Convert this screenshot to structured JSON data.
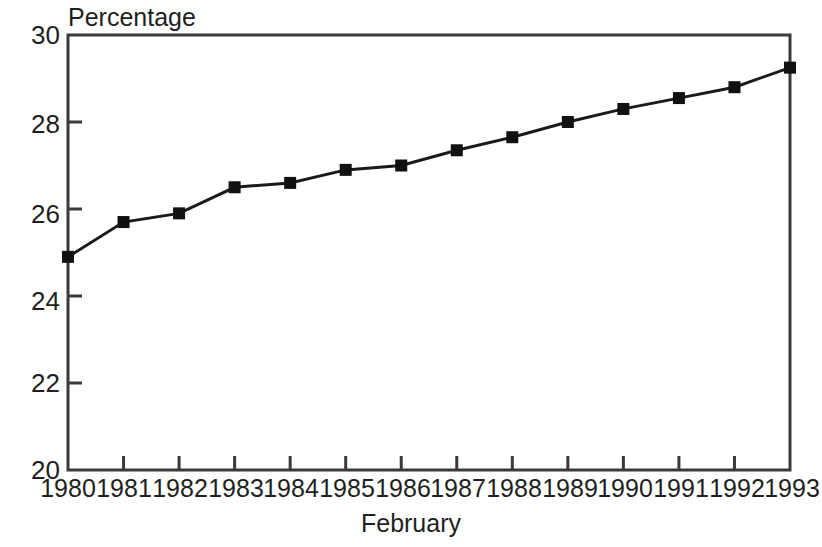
{
  "chart_data": {
    "type": "line",
    "title": "",
    "ylabel": "Percentage",
    "xlabel": "February",
    "categories": [
      "1980",
      "1981",
      "1982",
      "1983",
      "1984",
      "1985",
      "1986",
      "1987",
      "1988",
      "1989",
      "1990",
      "1991",
      "1992",
      "1993"
    ],
    "values": [
      24.9,
      25.7,
      25.9,
      26.5,
      26.6,
      26.9,
      27.0,
      27.35,
      27.65,
      28.0,
      28.3,
      28.55,
      28.8,
      29.25
    ],
    "series": [
      {
        "name": "Percentage",
        "values": [
          24.9,
          25.7,
          25.9,
          26.5,
          26.6,
          26.9,
          27.0,
          27.35,
          27.65,
          28.0,
          28.3,
          28.55,
          28.8,
          29.25
        ]
      }
    ],
    "ylim": [
      20,
      30
    ],
    "yticks": [
      20,
      22,
      24,
      26,
      28,
      30
    ],
    "ytick_labels": [
      "20",
      "22",
      "24",
      "26",
      "28",
      "30"
    ],
    "xtick_labels": [
      "1980",
      "1981",
      "1982",
      "1983",
      "1984",
      "1985",
      "1986",
      "1987",
      "1988",
      "1989",
      "1990",
      "1991",
      "1992",
      "1993"
    ],
    "grid": false,
    "legend": "none",
    "marker": "filled-square",
    "line_color": "#1a1a1a",
    "marker_color": "#111111",
    "frame_color": "#3a3a3a",
    "background": "#ffffff"
  }
}
